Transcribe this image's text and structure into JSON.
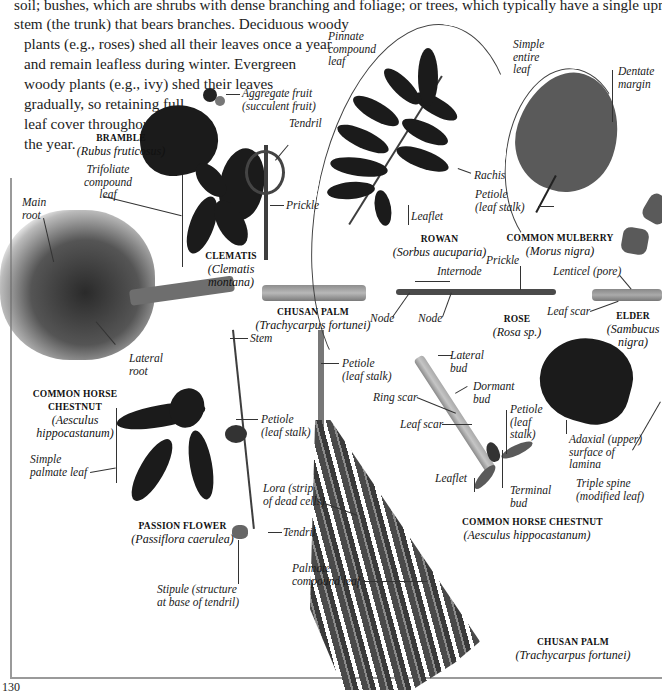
{
  "intro_text": {
    "lines": [
      "soil; bushes, which are shrubs with dense branching and foliage; or trees, which typically have a single upright",
      "stem (the trunk) that bears branches. Deciduous woody",
      "plants (e.g., roses) shed all their leaves once a year",
      "and remain leafless during winter. Evergreen",
      "woody plants (e.g., ivy) shed their leaves",
      "gradually, so retaining full",
      "leaf cover throughout",
      "the year."
    ]
  },
  "specimens": {
    "bramble": {
      "common": "BRAMBLE",
      "latin": "(Rubus fruticosus)"
    },
    "clematis": {
      "common": "CLEMATIS",
      "latin_1": "(Clematis",
      "latin_2": "montana)"
    },
    "rowan": {
      "common": "ROWAN",
      "latin": "(Sorbus aucuparia)"
    },
    "common_mulberry": {
      "common": "COMMON MULBERRY",
      "latin": "(Morus nigra)"
    },
    "chusan_palm_stem": {
      "common": "CHUSAN PALM",
      "latin": "(Trachycarpus fortunei)"
    },
    "rose": {
      "common": "ROSE",
      "latin": "(Rosa sp.)"
    },
    "elder": {
      "common": "ELDER",
      "latin_1": "(Sambucus",
      "latin_2": "nigra)"
    },
    "horse_chestnut_leaf": {
      "common_1": "COMMON HORSE",
      "common_2": "CHESTNUT",
      "latin_1": "(Aesculus",
      "latin_2": "hippocastanum)"
    },
    "passion_flower": {
      "common": "PASSION FLOWER",
      "latin": "(Passiflora caerulea)"
    },
    "horse_chestnut_twig": {
      "common": "COMMON HORSE CHESTNUT",
      "latin": "(Aesculus hippocastanum)"
    },
    "chusan_palm_leaf": {
      "common": "CHUSAN PALM",
      "latin": "(Trachycarpus fortunei)"
    }
  },
  "labels": {
    "pinnate_compound_leaf": [
      "Pinnate",
      "compound",
      "leaf"
    ],
    "simple_entire_leaf": [
      "Simple",
      "entire",
      "leaf"
    ],
    "dentate_margin": [
      "Dentate",
      "margin"
    ],
    "aggregate_fruit": [
      "Aggregate fruit",
      "(succulent fruit)"
    ],
    "tendril_bramble": "Tendril",
    "trifoliate_compound_leaf": [
      "Trifoliate",
      "compound",
      "leaf"
    ],
    "main_root": [
      "Main",
      "root"
    ],
    "prickle_bramble": "Prickle",
    "leaflet_rowan": "Leaflet",
    "rachis": "Rachis",
    "petiole_mulberry": [
      "Petiole",
      "(leaf stalk)"
    ],
    "internode": "Internode",
    "prickle_rose": "Prickle",
    "lenticel": "Lenticel (pore)",
    "node_1": "Node",
    "node_2": "Node",
    "leaf_scar_elder": "Leaf scar",
    "stem_passion": "Stem",
    "lateral_root": [
      "Lateral",
      "root"
    ],
    "petiole_palm": [
      "Petiole",
      "(leaf stalk)"
    ],
    "lateral_bud": [
      "Lateral",
      "bud"
    ],
    "dormant_bud": [
      "Dormant",
      "bud"
    ],
    "ring_scar": "Ring scar",
    "leaf_scar_chestnut": "Leaf scar",
    "petiole_chestnut": [
      "Petiole",
      "(leaf",
      "stalk)"
    ],
    "simple_palmate_leaf": [
      "Simple",
      "palmate leaf"
    ],
    "petiole_passion": [
      "Petiole",
      "(leaf stalk)"
    ],
    "adaxial_surface": [
      "Adaxial (upper)",
      "surface of",
      "lamina"
    ],
    "triple_spine": [
      "Triple spine",
      "(modified leaf)"
    ],
    "leaflet_chestnut": "Leaflet",
    "terminal_bud": [
      "Terminal",
      "bud"
    ],
    "lora": [
      "Lora (strip",
      "of dead cells)"
    ],
    "tendril_passion": "Tendril",
    "palmate_compound_leaf": [
      "Palmate",
      "compound leaf"
    ],
    "stipule": [
      "Stipule (structure",
      "at base of tendril)"
    ]
  },
  "page_number": "130",
  "colors": {
    "ink": "#1a1a1a",
    "leaf_dark": "#1b1b1b",
    "leaf_mid": "#5a5a5a",
    "frame": "#9a9a9a"
  }
}
